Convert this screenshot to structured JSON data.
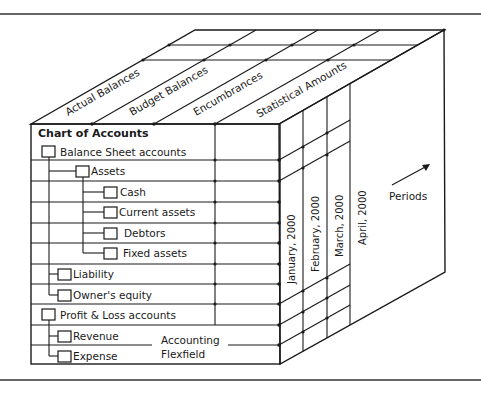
{
  "diagram": {
    "title": "Chart of Accounts",
    "top_face_labels": [
      "Actual Balances",
      "Budget Balances",
      "Encumbrances",
      "Statistical Amounts"
    ],
    "periods": [
      "January, 2000",
      "February, 2000",
      "March, 2000",
      "April, 2000"
    ],
    "periods_axis_label": "Periods",
    "flexfield_label_line1": "Accounting",
    "flexfield_label_line2": "Flexfield",
    "tree": [
      {
        "label": "Balance Sheet accounts",
        "level": 0
      },
      {
        "label": "Assets",
        "level": 1
      },
      {
        "label": "Cash",
        "level": 2
      },
      {
        "label": "Current assets",
        "level": 2
      },
      {
        "label": "Debtors",
        "level": 2
      },
      {
        "label": "Fixed assets",
        "level": 2
      },
      {
        "label": "Liability",
        "level": 1
      },
      {
        "label": "Owner's equity",
        "level": 1
      },
      {
        "label": "Profit & Loss accounts",
        "level": 0
      },
      {
        "label": "Revenue",
        "level": 1
      },
      {
        "label": "Expense",
        "level": 1
      }
    ]
  }
}
